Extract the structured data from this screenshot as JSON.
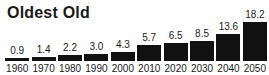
{
  "chart_data": {
    "type": "bar",
    "title": "Oldest Old",
    "categories": [
      "1960",
      "1970",
      "1980",
      "1990",
      "2000",
      "2010",
      "2020",
      "2030",
      "2040",
      "2050"
    ],
    "values": [
      0.9,
      1.4,
      2.2,
      3.0,
      4.3,
      5.7,
      6.5,
      8.5,
      13.6,
      18.2
    ],
    "data_labels": [
      "0.9",
      "1.4",
      "2.2",
      "3.0",
      "4.3",
      "5.7",
      "6.5",
      "8.5",
      "13.6",
      "18.2"
    ],
    "xlabel": "",
    "ylabel": "",
    "ylim": [
      0,
      18.2
    ],
    "grid": false,
    "legend": false,
    "data_labels_position": "above-bars",
    "bar_color": "#111111",
    "text_color": "#1a1a1a",
    "background_color": "#ffffff",
    "bar_heights_px": [
      3,
      4,
      6,
      7,
      9,
      16,
      18,
      20,
      27,
      39
    ]
  }
}
